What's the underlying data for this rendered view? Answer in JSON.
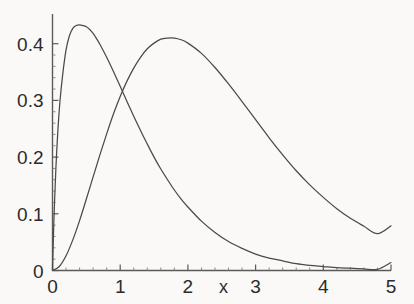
{
  "chart_data": {
    "type": "line",
    "title": "",
    "subtitle": "",
    "xlabel": "x",
    "ylabel": "",
    "xlim": [
      0,
      5
    ],
    "ylim": [
      0,
      0.45
    ],
    "grid": false,
    "legend": "none",
    "background_color": "#faf9f7",
    "axis_color": "#555555",
    "xticks": [
      0,
      1,
      2,
      3,
      4,
      5
    ],
    "xtick_labels": [
      "0",
      "1",
      "2",
      "3",
      "4",
      "5"
    ],
    "yticks": [
      0,
      0.1,
      0.2,
      0.3,
      0.4
    ],
    "ytick_labels": [
      "0",
      "0.1",
      "0.2",
      "0.3",
      "0.4"
    ],
    "minor_xticks_per_interval": 4,
    "minor_yticks_per_interval": 4,
    "annotations": [],
    "series": [
      {
        "name": "curve-1",
        "color": "#4a4a4a",
        "peak_x": 0.5,
        "peak_y": 0.43,
        "x": [
          0.0,
          0.02,
          0.05,
          0.08,
          0.11,
          0.15,
          0.2,
          0.25,
          0.3,
          0.35,
          0.4,
          0.45,
          0.5,
          0.55,
          0.6,
          0.65,
          0.7,
          0.8,
          0.9,
          1.0,
          1.1,
          1.2,
          1.3,
          1.4,
          1.5,
          1.6,
          1.7,
          1.8,
          1.9,
          2.0,
          2.2,
          2.4,
          2.6,
          2.8,
          3.0,
          3.2,
          3.4,
          3.6,
          3.8,
          4.0,
          4.2,
          4.4,
          4.6,
          4.8,
          5.0
        ],
        "y": [
          0.0,
          0.085,
          0.18,
          0.248,
          0.298,
          0.345,
          0.389,
          0.414,
          0.427,
          0.432,
          0.433,
          0.432,
          0.43,
          0.425,
          0.418,
          0.409,
          0.399,
          0.376,
          0.351,
          0.325,
          0.298,
          0.272,
          0.247,
          0.223,
          0.2,
          0.179,
          0.16,
          0.142,
          0.126,
          0.112,
          0.087,
          0.067,
          0.051,
          0.039,
          0.029,
          0.022,
          0.017,
          0.012,
          0.009,
          0.007,
          0.005,
          0.004,
          0.003,
          0.002,
          0.014
        ]
      },
      {
        "name": "curve-2",
        "color": "#4a4a4a",
        "peak_x": 1.72,
        "peak_y": 0.41,
        "x": [
          0.0,
          0.1,
          0.2,
          0.3,
          0.4,
          0.5,
          0.6,
          0.7,
          0.8,
          0.9,
          1.0,
          1.1,
          1.2,
          1.3,
          1.4,
          1.5,
          1.6,
          1.7,
          1.8,
          1.9,
          2.0,
          2.2,
          2.4,
          2.6,
          2.8,
          3.0,
          3.2,
          3.4,
          3.6,
          3.8,
          4.0,
          4.2,
          4.4,
          4.6,
          4.8,
          5.0
        ],
        "y": [
          0.0,
          0.007,
          0.026,
          0.054,
          0.088,
          0.126,
          0.165,
          0.204,
          0.241,
          0.276,
          0.307,
          0.334,
          0.357,
          0.376,
          0.391,
          0.401,
          0.408,
          0.41,
          0.41,
          0.407,
          0.401,
          0.383,
          0.358,
          0.329,
          0.298,
          0.266,
          0.234,
          0.204,
          0.176,
          0.151,
          0.129,
          0.109,
          0.092,
          0.078,
          0.065,
          0.079
        ]
      }
    ]
  },
  "axis": {
    "x_label": "x"
  },
  "ticks": {
    "x": [
      {
        "label": "0",
        "value": 0
      },
      {
        "label": "1",
        "value": 1
      },
      {
        "label": "2",
        "value": 2
      },
      {
        "label": "3",
        "value": 3
      },
      {
        "label": "4",
        "value": 4
      },
      {
        "label": "5",
        "value": 5
      }
    ],
    "y": [
      {
        "label": "0.4",
        "value": 0.4
      },
      {
        "label": "0.3",
        "value": 0.3
      },
      {
        "label": "0.2",
        "value": 0.2
      },
      {
        "label": "0.1",
        "value": 0.1
      },
      {
        "label": "0",
        "value": 0
      }
    ]
  }
}
